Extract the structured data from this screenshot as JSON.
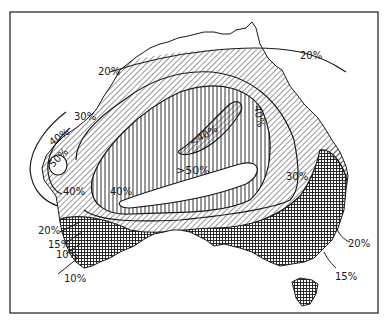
{
  "figure": {
    "type": "contour map",
    "region": "Australia",
    "legend_patterns": {
      "white": "lowest band inside 20% coast / >50% core",
      "diagonal_hatch": "20%–30% / 30%–40% bands",
      "vertical_hatch": "40%–50% band",
      "cross_hatch": "below 20% (south and east coastal)"
    }
  },
  "labels": {
    "north_20": "20%",
    "ne_20": "20%",
    "west_30": "30%",
    "west_40a": "40%",
    "west_inner": "50%",
    "west_40b": "40%",
    "central_40": "40%",
    "lt40": "<40%",
    "gt50": ">50%",
    "east_40": "40%",
    "east_30": "30%",
    "sw_20": "20%",
    "sw_15": "15%",
    "sw_10a": "10%",
    "sw_10b": "10%",
    "se_20": "20%",
    "se_15": "15%"
  },
  "colors": {
    "ink": "#1a1a1a",
    "paper": "#ffffff"
  }
}
